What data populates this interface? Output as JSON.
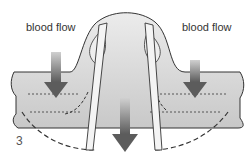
{
  "diagram": {
    "label_left": "blood flow",
    "label_right": "blood flow",
    "figure_number": "3"
  },
  "colors": {
    "vessel_fill": "#dcdcdc",
    "arrow": "#666666",
    "outline": "#333333"
  }
}
